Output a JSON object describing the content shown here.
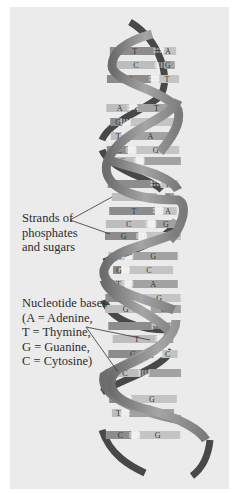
{
  "diagram": {
    "colors": {
      "panel_bg": "#ebebeb",
      "strand_front": "#8f8f8f",
      "strand_back": "#4a4a4a",
      "base_dark": "#8a8a8a",
      "base_light": "#bdbdbd",
      "hbond": "#ffffff",
      "leader_line": "#333333"
    },
    "annotations": [
      {
        "id": "strands",
        "lines": [
          "Strands of",
          "phosphates",
          "and sugars"
        ]
      },
      {
        "id": "bases",
        "lines": [
          "Nucleotide bases",
          "(A = Adenine,",
          "T = Thymine,",
          "G = Guanine,",
          "C = Cytosine)"
        ]
      }
    ],
    "base_pairs": [
      {
        "left": "T",
        "right": "A",
        "y": 51
      },
      {
        "left": "C",
        "right": "G",
        "y": 65
      },
      {
        "left": "A",
        "right": "T",
        "y": 79
      },
      {
        "left": "A",
        "right": "T",
        "y": 108
      },
      {
        "left": "G",
        "right": "C",
        "y": 122
      },
      {
        "left": "T",
        "right": "A",
        "y": 136
      },
      {
        "left": "C",
        "right": "G",
        "y": 150
      },
      {
        "left": "G",
        "right": "",
        "y": 161
      },
      {
        "left": "",
        "right": "T",
        "y": 184
      },
      {
        "left": "G",
        "right": "C",
        "y": 197
      },
      {
        "left": "T",
        "right": "A",
        "y": 211
      },
      {
        "left": "C",
        "right": "G",
        "y": 224
      },
      {
        "left": "G",
        "right": "",
        "y": 236
      },
      {
        "left": "C",
        "right": "G",
        "y": 256
      },
      {
        "left": "G",
        "right": "C",
        "y": 270
      },
      {
        "left": "T",
        "right": "A",
        "y": 284
      },
      {
        "left": "C",
        "right": "G",
        "y": 298
      },
      {
        "left": "G",
        "right": "C",
        "y": 309
      },
      {
        "left": "",
        "right": "C",
        "y": 326
      },
      {
        "left": "T",
        "right": "A",
        "y": 339
      },
      {
        "left": "G",
        "right": "C",
        "y": 354
      },
      {
        "left": "C",
        "right": "",
        "y": 373
      },
      {
        "left": "",
        "right": "G",
        "y": 399
      },
      {
        "left": "T",
        "right": "A",
        "y": 413
      },
      {
        "left": "C",
        "right": "G",
        "y": 435
      }
    ]
  }
}
